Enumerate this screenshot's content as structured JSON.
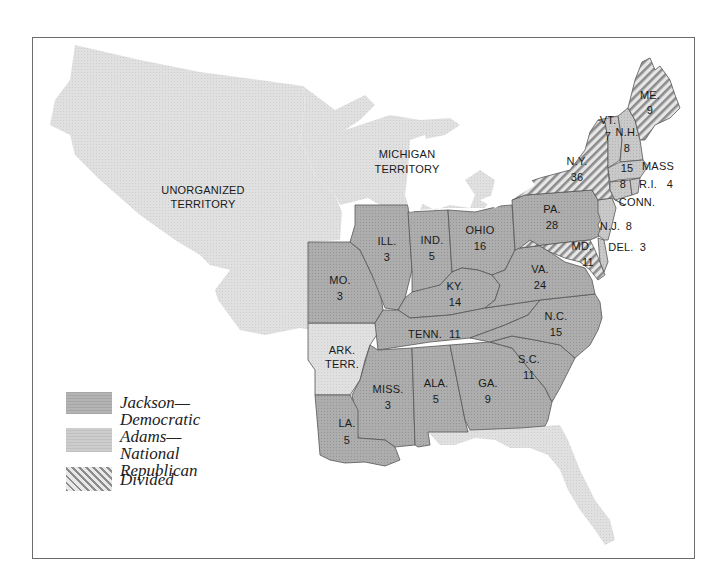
{
  "map": {
    "colors": {
      "jackson": "#a8a8a8",
      "adams": "#c6c6c6",
      "territory": "#dddddd",
      "divided_hatch": "#8a8a8a",
      "border": "#555555",
      "frame": "#6b6b6b"
    },
    "territories": [
      {
        "id": "unorganized",
        "line1": "UNORGANIZED",
        "line2": "TERRITORY"
      },
      {
        "id": "michigan",
        "line1": "MICHIGAN",
        "line2": "TERRITORY"
      },
      {
        "id": "arkansas",
        "line1": "ARK.",
        "line2": "TERR."
      }
    ],
    "states": [
      {
        "abbr": "ME.",
        "votes": "9",
        "result": "divided"
      },
      {
        "abbr": "VT.",
        "votes": "7",
        "result": "adams"
      },
      {
        "abbr": "N.H.",
        "votes": "8",
        "result": "adams"
      },
      {
        "abbr": "MASS",
        "votes": "15",
        "result": "adams"
      },
      {
        "abbr": "R.I.",
        "votes": "4",
        "result": "adams"
      },
      {
        "abbr": "CONN.",
        "votes": "8",
        "result": "adams"
      },
      {
        "abbr": "N.Y.",
        "votes": "36",
        "result": "divided"
      },
      {
        "abbr": "N.J.",
        "votes": "8",
        "result": "adams"
      },
      {
        "abbr": "PA.",
        "votes": "28",
        "result": "jackson"
      },
      {
        "abbr": "DEL.",
        "votes": "3",
        "result": "adams"
      },
      {
        "abbr": "MD.",
        "votes": "11",
        "result": "divided"
      },
      {
        "abbr": "VA.",
        "votes": "24",
        "result": "jackson"
      },
      {
        "abbr": "N.C.",
        "votes": "15",
        "result": "jackson"
      },
      {
        "abbr": "S.C.",
        "votes": "11",
        "result": "jackson"
      },
      {
        "abbr": "GA.",
        "votes": "9",
        "result": "jackson"
      },
      {
        "abbr": "ALA.",
        "votes": "5",
        "result": "jackson"
      },
      {
        "abbr": "MISS.",
        "votes": "3",
        "result": "jackson"
      },
      {
        "abbr": "LA.",
        "votes": "5",
        "result": "jackson"
      },
      {
        "abbr": "TENN.",
        "votes": "11",
        "result": "jackson"
      },
      {
        "abbr": "KY.",
        "votes": "14",
        "result": "jackson"
      },
      {
        "abbr": "OHIO",
        "votes": "16",
        "result": "jackson"
      },
      {
        "abbr": "IND.",
        "votes": "5",
        "result": "jackson"
      },
      {
        "abbr": "ILL.",
        "votes": "3",
        "result": "jackson"
      },
      {
        "abbr": "MO.",
        "votes": "3",
        "result": "jackson"
      }
    ]
  },
  "legend": {
    "items": [
      {
        "key": "jackson",
        "line1": "Jackson—Democratic",
        "line2": ""
      },
      {
        "key": "adams",
        "line1": "Adams—",
        "line2": "National Republican"
      },
      {
        "key": "divided",
        "line1": "Divided",
        "line2": ""
      }
    ]
  }
}
